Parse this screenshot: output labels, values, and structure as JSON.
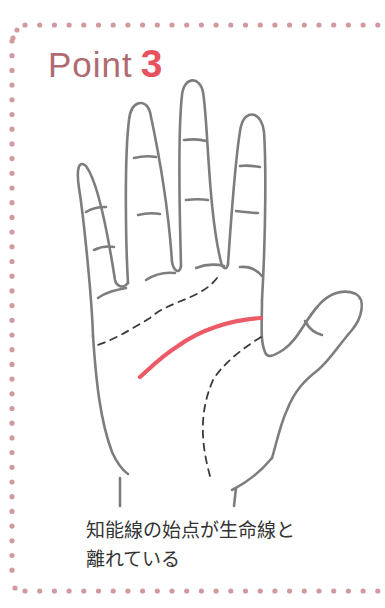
{
  "card": {
    "title_word": "Point",
    "title_number": "3",
    "caption_lines": [
      "知能線の始点が生命線と",
      "離れている"
    ]
  },
  "colors": {
    "border_dots": "#d09aa0",
    "title_word": "#b06b72",
    "title_number": "#e8525e",
    "highlight_line": "#ec5a66",
    "outline": "#7d7d7d",
    "dashed_line": "#3a3a3a",
    "caption_text": "#333333"
  },
  "illustration": {
    "subject": "palm-of-hand",
    "highlighted_line": "head-line (知能線)",
    "dashed_lines": [
      "heart-line",
      "life-line"
    ]
  }
}
